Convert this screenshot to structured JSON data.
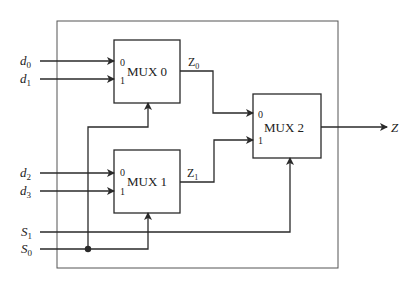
{
  "diagram": {
    "inputs": [
      {
        "name": "d",
        "sub": "0"
      },
      {
        "name": "d",
        "sub": "1"
      },
      {
        "name": "d",
        "sub": "2"
      },
      {
        "name": "d",
        "sub": "3"
      }
    ],
    "selects": [
      {
        "name": "S",
        "sub": "1"
      },
      {
        "name": "S",
        "sub": "0"
      }
    ],
    "muxes": [
      {
        "label": "MUX 0",
        "in0": "0",
        "in1": "1"
      },
      {
        "label": "MUX 1",
        "in0": "0",
        "in1": "1"
      },
      {
        "label": "MUX 2",
        "in0": "0",
        "in1": "1"
      }
    ],
    "intermediate": [
      {
        "name": "Z",
        "sub": "0"
      },
      {
        "name": "Z",
        "sub": "1"
      }
    ],
    "output": {
      "name": "Z"
    },
    "colors": {
      "line": "#2a2a2a",
      "frame": "#555555",
      "background": "#ffffff"
    }
  }
}
